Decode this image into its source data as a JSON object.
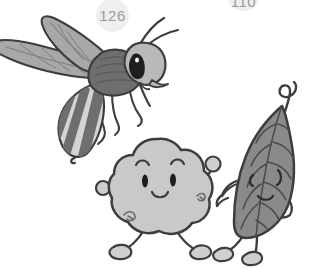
{
  "canvas": {
    "width": 310,
    "height": 270,
    "background": "#ffffff",
    "style": "grayscale cartoon line illustration"
  },
  "badges": [
    {
      "name": "badge-126",
      "label": "126",
      "fill": "#efefef",
      "text_color": "#9a9a9a",
      "clipped": false
    },
    {
      "name": "badge-110",
      "label": "110",
      "fill": "#efefef",
      "text_color": "#9a9a9a",
      "clipped": true
    }
  ],
  "characters": [
    {
      "name": "wasp-character",
      "label": "wasp",
      "body_fill": "#6e6e6e",
      "abdomen_stripe_light": "#d4d4d4",
      "abdomen_stripe_dark": "#6e6e6e",
      "wing_fill": "#a8a8a8",
      "head_fill": "#b9b9b9",
      "outline": "#3d3d3d",
      "eye_fill": "#1e1e1e"
    },
    {
      "name": "blob-character",
      "label": "cloud blob",
      "body_fill": "#c9c9c9",
      "outline": "#3d3d3d",
      "eye_fill": "#1e1e1e"
    },
    {
      "name": "leaf-character",
      "label": "leaf",
      "body_fill": "#8a8a8a",
      "outline": "#3d3d3d",
      "vein_color": "#4a4a4a"
    }
  ],
  "colors": {
    "outline": "#3d3d3d",
    "badge_fill": "#efefef",
    "badge_text": "#9a9a9a",
    "light_gray": "#c9c9c9",
    "mid_gray": "#8a8a8a",
    "dark_gray": "#6e6e6e",
    "wing_gray": "#a8a8a8",
    "head_gray": "#b9b9b9",
    "black": "#1e1e1e"
  }
}
